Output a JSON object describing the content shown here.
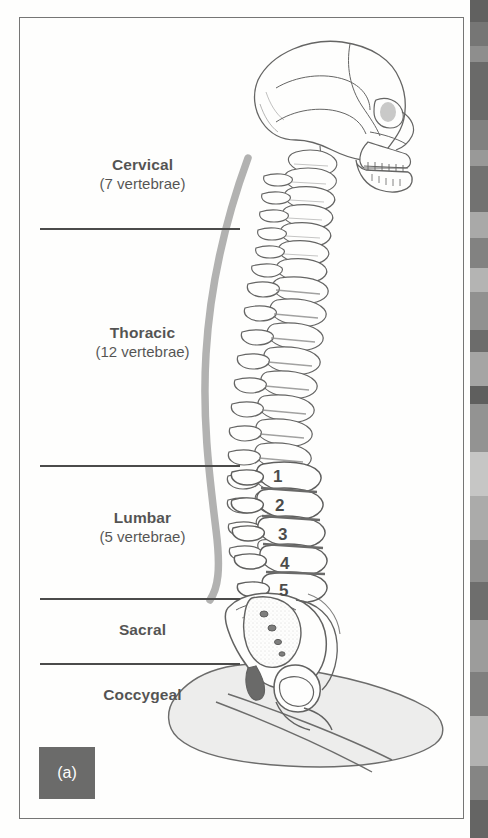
{
  "figure": {
    "panel_tag": "(a)",
    "caption_regions": [
      {
        "name": "Cervical",
        "count": "(7 vertebrae)"
      },
      {
        "name": "Thoracic",
        "count": "(12 vertebrae)"
      },
      {
        "name": "Lumbar",
        "count": "(5 vertebrae)"
      },
      {
        "name": "Sacral",
        "count": ""
      },
      {
        "name": "Coccygeal",
        "count": ""
      }
    ],
    "lumbar_numbers": [
      "1",
      "2",
      "3",
      "4",
      "5"
    ],
    "colors": {
      "frame_border": "#4a4a4a",
      "divider": "#111111",
      "text": "#1b1b1b",
      "curve_gray": "#9a9a9a",
      "panel_tag_bg": "#3b3b3b",
      "panel_tag_text": "#ffffff",
      "seat_fill": "#e6e6e6",
      "background": "#ffffff"
    }
  }
}
